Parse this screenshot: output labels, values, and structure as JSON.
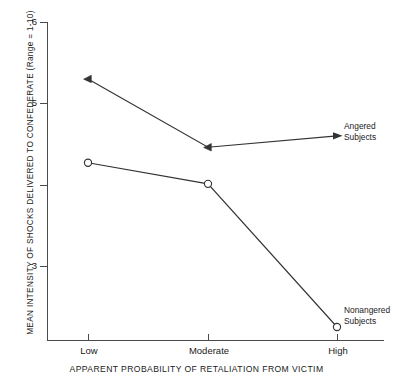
{
  "chart_data": {
    "type": "line",
    "title": "",
    "xlabel": "APPARENT PROBABILITY OF RETALIATION FROM VICTIM",
    "ylabel": "MEAN INTENSITY OF SHOCKS DELIVERED TO CONFEDERATE (Range = 1-10)",
    "categories": [
      "Low",
      "Moderate",
      "High"
    ],
    "ylim": [
      2.0,
      6.0
    ],
    "yticks": [
      6,
      5,
      4,
      3
    ],
    "ytick_labels": [
      "6",
      "",
      "",
      "3"
    ],
    "ytick_labels_visible": [
      "6",
      "5",
      "3"
    ],
    "grid": false,
    "legend_position": "inline-right-annotations",
    "series": [
      {
        "name": "Angered Subjects",
        "marker": "filled-triangle",
        "values": [
          5.3,
          4.46,
          4.6
        ],
        "annotation": "Angered\nSubjects",
        "annotation_line1": "Angered",
        "annotation_line2": "Subjects",
        "has_arrow": true
      },
      {
        "name": "Nonangered Subjects",
        "marker": "open-circle",
        "values": [
          4.27,
          4.01,
          2.25
        ],
        "annotation": "Nonangered\nSubjects",
        "annotation_line1": "Nonangered",
        "annotation_line2": "Subjects",
        "has_arrow": false
      }
    ]
  },
  "axes": {
    "y_tick_6": "6",
    "y_tick_5": "5",
    "y_tick_3": "3",
    "x_tick_low": "Low",
    "x_tick_moderate": "Moderate",
    "x_tick_high": "High"
  },
  "colors": {
    "line": "#333333",
    "axis": "#4a4a4a",
    "text": "#1a1a1a",
    "background": "#ffffff"
  }
}
